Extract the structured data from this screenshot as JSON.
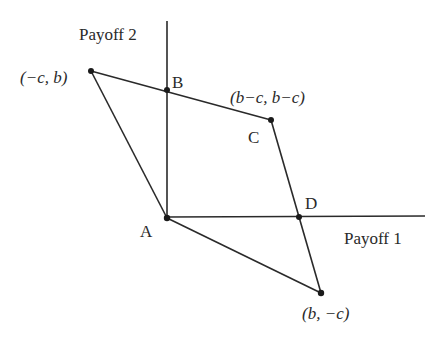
{
  "axes": {
    "x_label": "Payoff 1",
    "y_label": "Payoff 2",
    "origin": {
      "x": 167,
      "y": 217
    },
    "y_top": 21,
    "x_right": 425
  },
  "points": {
    "A": {
      "label": "A",
      "x": 167,
      "y": 218
    },
    "B": {
      "label": "B",
      "x": 167,
      "y": 90
    },
    "C": {
      "label": "C",
      "x": 271,
      "y": 120
    },
    "D": {
      "label": "D",
      "x": 299,
      "y": 217
    },
    "P_neg_c_b": {
      "coord_label": "(−c, b)",
      "x": 91,
      "y": 71
    },
    "P_bc_bc": {
      "coord_label": "(b−c, b−c)",
      "x": 271,
      "y": 120
    },
    "P_b_neg_c": {
      "coord_label": "(b, −c)",
      "x": 321,
      "y": 293
    }
  },
  "polygon": {
    "vertices_order": [
      "A",
      "P_neg_c_b",
      "C",
      "P_b_neg_c"
    ],
    "stroke": "#2a2a2a"
  },
  "labels": {
    "payoff2": "Payoff 2",
    "payoff1": "Payoff 1",
    "A": "A",
    "B": "B",
    "C": "C",
    "D": "D",
    "neg_c_b": "(−c, b)",
    "bc_bc": "(b−c, b−c)",
    "b_neg_c": "(b, −c)"
  }
}
